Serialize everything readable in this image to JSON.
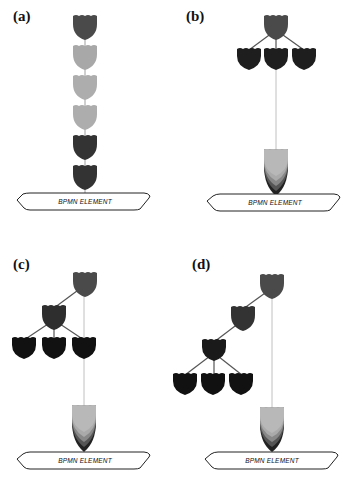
{
  "figure": {
    "panels": [
      {
        "id": "a",
        "label": "(a)",
        "platform_label": "BPMN ELEMENT",
        "structure": "linear chain of 6 nodes"
      },
      {
        "id": "b",
        "label": "(b)",
        "platform_label": "BPMN ELEMENT",
        "structure": "root with 3 children, stacked node on platform"
      },
      {
        "id": "c",
        "label": "(c)",
        "platform_label": "BPMN ELEMENT",
        "structure": "root, 1 child with 3 children, stacked node on platform"
      },
      {
        "id": "d",
        "label": "(d)",
        "platform_label": "BPMN ELEMENT",
        "structure": "root, 2-level chain then 3 children, stacked node on platform"
      }
    ],
    "colors": {
      "root": "#4a4a4a",
      "light": "#a8a8a8",
      "dark": "#2a2a2a",
      "darkest": "#111111",
      "edge": "#555555",
      "connector": "#b0b0b0",
      "platform_stroke": "#222222"
    }
  }
}
